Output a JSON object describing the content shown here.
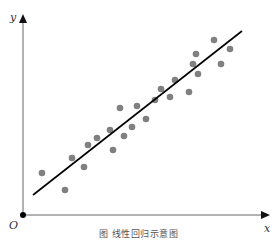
{
  "chart_data": {
    "type": "scatter",
    "title": "",
    "xlabel": "x",
    "ylabel": "y",
    "origin_label": "O",
    "caption": "图 线性回归示意图",
    "grid": false,
    "legend": "none",
    "points_pixel": [
      [
        42,
        173
      ],
      [
        65,
        190
      ],
      [
        72,
        158
      ],
      [
        84,
        167
      ],
      [
        88,
        145
      ],
      [
        97,
        138
      ],
      [
        110,
        130
      ],
      [
        113,
        150
      ],
      [
        120,
        108
      ],
      [
        124,
        136
      ],
      [
        132,
        127
      ],
      [
        137,
        106
      ],
      [
        146,
        119
      ],
      [
        155,
        100
      ],
      [
        161,
        89
      ],
      [
        170,
        97
      ],
      [
        175,
        80
      ],
      [
        189,
        92
      ],
      [
        193,
        64
      ],
      [
        196,
        54
      ],
      [
        198,
        74
      ],
      [
        214,
        40
      ],
      [
        221,
        64
      ],
      [
        230,
        49
      ]
    ],
    "regression_line_pixel": [
      [
        33,
        195
      ],
      [
        242,
        31
      ]
    ],
    "colors": {
      "points": "#808080",
      "axes": "#555555",
      "line": "#000000"
    }
  }
}
